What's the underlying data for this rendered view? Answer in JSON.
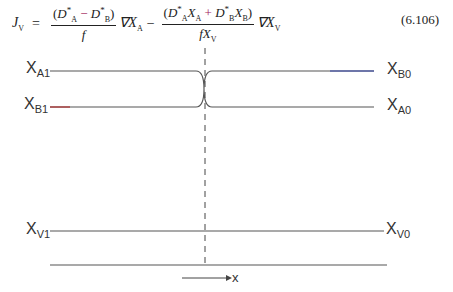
{
  "equation": {
    "lhs": "J",
    "lhs_sub": "V",
    "equals": "=",
    "term1_num": "(D*A − D*B)",
    "term1_den": "f",
    "term1_grad": "∇X",
    "term1_grad_sub": "A",
    "minus": "−",
    "term2_num": "(D*A XA + D*B XB)",
    "term2_den": "fX",
    "term2_den_sub": "V",
    "term2_grad": "∇X",
    "term2_grad_sub": "V",
    "number": "(6.106)"
  },
  "figure": {
    "labels": {
      "xa1": {
        "base": "X",
        "sub": "A1"
      },
      "xb1": {
        "base": "X",
        "sub": "B1"
      },
      "xb0": {
        "base": "X",
        "sub": "B0"
      },
      "xa0": {
        "base": "X",
        "sub": "A0"
      },
      "xv1": {
        "base": "X",
        "sub": "V1"
      },
      "xv0": {
        "base": "X",
        "sub": "V0"
      }
    },
    "axis_label": "x"
  }
}
